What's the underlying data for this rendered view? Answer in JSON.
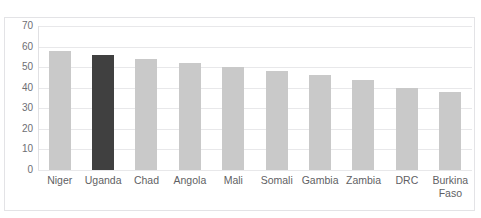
{
  "figure": {
    "clipped_caption": "",
    "background": "#ffffff",
    "frame_border_color": "#e3e3e6"
  },
  "chart_data": {
    "type": "bar",
    "title": "",
    "subtitle": "",
    "xlabel": "",
    "ylabel": "",
    "categories": [
      "Niger",
      "Uganda",
      "Chad",
      "Angola",
      "Mali",
      "Somali",
      "Gambia",
      "Zambia",
      "DRC",
      "Burkina\nFaso"
    ],
    "values": [
      58,
      56,
      54,
      52,
      50,
      48,
      46,
      44,
      40,
      38
    ],
    "highlight_index": 1,
    "ylim": [
      0,
      70
    ],
    "ytick_values": [
      70,
      60,
      50,
      40,
      30,
      20,
      10,
      0
    ],
    "ytick_labels": [
      "70",
      "60",
      "50",
      "40",
      "30",
      "20",
      "10",
      "0"
    ],
    "grid": true,
    "grid_axis": "y",
    "grid_color": "#e8e8ea",
    "legend": false,
    "legend_position": "none",
    "bar_color": "#c9c9c9",
    "highlight_color": "#404040",
    "bar_width_px": 22,
    "annotations": []
  }
}
